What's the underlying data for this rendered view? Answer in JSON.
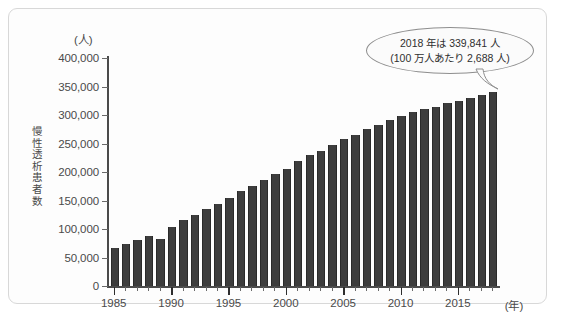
{
  "chart_data": {
    "type": "bar",
    "title": "",
    "subtitle": "",
    "xlabel": "(年)",
    "ylabel": "慢性透析患者数",
    "yunit": "(人)",
    "ylim": [
      0,
      400000
    ],
    "ytick_labels": [
      "400,000",
      "350,000",
      "300,000",
      "250,000",
      "200,000",
      "150,000",
      "100,000",
      "50,000",
      "0"
    ],
    "ytick_values": [
      400000,
      350000,
      300000,
      250000,
      200000,
      150000,
      100000,
      50000,
      0
    ],
    "xtick_labels": [
      "1985",
      "1990",
      "1995",
      "2000",
      "2005",
      "2010",
      "2015"
    ],
    "xtick_values": [
      1985,
      1990,
      1995,
      2000,
      2005,
      2010,
      2015
    ],
    "grid": false,
    "legend": null,
    "bar_color": "#3d3d3d",
    "categories": [
      1985,
      1986,
      1987,
      1988,
      1989,
      1990,
      1991,
      1992,
      1993,
      1994,
      1995,
      1996,
      1997,
      1998,
      1999,
      2000,
      2001,
      2002,
      2003,
      2004,
      2005,
      2006,
      2007,
      2008,
      2009,
      2010,
      2011,
      2012,
      2013,
      2014,
      2015,
      2016,
      2017,
      2018
    ],
    "values": [
      66310,
      73537,
      80553,
      88534,
      83221,
      103296,
      116303,
      123926,
      134298,
      143709,
      154413,
      167192,
      175988,
      185322,
      197213,
      206134,
      219183,
      229538,
      237710,
      248166,
      257765,
      264473,
      275119,
      282622,
      290675,
      298252,
      304856,
      310007,
      314180,
      320448,
      325000,
      329609,
      334505,
      339841
    ],
    "annotations": [
      {
        "name": "callout-2018",
        "line1": "2018 年は 339,841 人",
        "line2": "(100 万人あたり 2,688 人)",
        "target_year": 2018,
        "target_value": 339841,
        "per_million": 2688
      }
    ]
  }
}
